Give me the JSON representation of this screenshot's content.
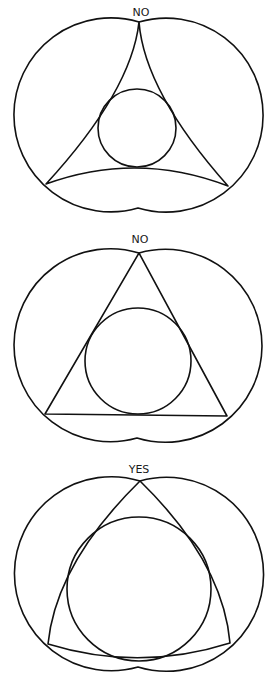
{
  "figures": [
    {
      "label": "NO",
      "triangle": "concave-sided triangle",
      "circle": "small inscribed circle"
    },
    {
      "label": "NO",
      "triangle": "straight-sided triangle",
      "circle": "inscribed circle"
    },
    {
      "label": "YES",
      "triangle": "convex-sided triangle",
      "circle": "large inscribed circle"
    }
  ],
  "colors": {
    "line": "#111111",
    "background": "#ffffff"
  }
}
